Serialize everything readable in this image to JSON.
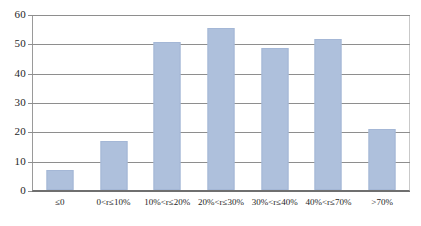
{
  "chart_data": {
    "type": "bar",
    "title": "",
    "subtitle": "",
    "xlabel": "",
    "ylabel": "",
    "categories": [
      "≤0",
      "0<r≤10%",
      "10%<r≤20%",
      "20%<r≤30%",
      "30%<r≤40%",
      "40%<r≤70%",
      ">70%"
    ],
    "values": [
      7,
      17,
      51,
      56,
      49,
      52,
      21
    ],
    "ylim": [
      0,
      60
    ],
    "ytick_labels": [
      "0",
      "10",
      "20",
      "30",
      "40",
      "50",
      "60"
    ],
    "ytick_values": [
      0,
      10,
      20,
      30,
      40,
      50,
      60
    ],
    "grid": true,
    "grid_axis": "y",
    "legend": false,
    "legend_position": "none",
    "bar_color": "#aec0dc",
    "bar_border_color": "#a4b7d6",
    "gridline_color": "#8e8e8e",
    "axis_color": "#6f6f6f",
    "background_color": "#ffffff"
  }
}
